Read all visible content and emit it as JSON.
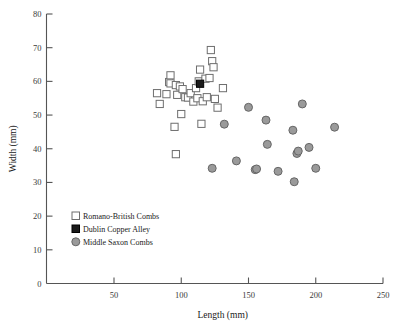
{
  "chart_data": {
    "type": "scatter",
    "title": "",
    "xlabel": "Length (mm)",
    "ylabel": "Width (mm)",
    "xlim": [
      0,
      250
    ],
    "ylim": [
      0,
      80
    ],
    "xticks": [
      50,
      100,
      150,
      200,
      250
    ],
    "yticks": [
      0,
      10,
      20,
      30,
      40,
      50,
      60,
      70,
      80
    ],
    "xtick_labels": [
      "50",
      "100",
      "150",
      "200",
      "250"
    ],
    "ytick_labels": [
      "0",
      "10",
      "20",
      "30",
      "40",
      "50",
      "60",
      "70",
      "80"
    ],
    "grid": false,
    "legend_position": "lower-left",
    "series": [
      {
        "name": "Romano-British Combs",
        "marker": "square",
        "fill": "#ffffff",
        "stroke": "#6e6e6e",
        "points": [
          [
            82,
            56.5
          ],
          [
            84,
            53.3
          ],
          [
            89,
            56.2
          ],
          [
            91,
            59.8
          ],
          [
            92,
            61.8
          ],
          [
            92,
            59.4
          ],
          [
            95,
            46.5
          ],
          [
            96,
            38.4
          ],
          [
            96,
            58.9
          ],
          [
            97,
            56.0
          ],
          [
            99,
            58.5
          ],
          [
            100,
            50.3
          ],
          [
            101,
            57.7
          ],
          [
            103,
            55.3
          ],
          [
            105,
            55.2
          ],
          [
            107,
            56.5
          ],
          [
            109,
            54.0
          ],
          [
            111,
            58.0
          ],
          [
            112,
            55.0
          ],
          [
            113,
            60.0
          ],
          [
            114,
            63.5
          ],
          [
            115,
            47.4
          ],
          [
            116,
            54.1
          ],
          [
            118,
            60.8
          ],
          [
            119,
            55.3
          ],
          [
            121,
            61.0
          ],
          [
            122,
            69.3
          ],
          [
            123,
            66.0
          ],
          [
            124,
            64.2
          ],
          [
            125,
            54.8
          ],
          [
            127,
            52.2
          ],
          [
            131,
            58.0
          ]
        ]
      },
      {
        "name": "Dublin Copper Alley",
        "marker": "square",
        "fill": "#1a1a1a",
        "stroke": "#000000",
        "points": [
          [
            114,
            59.3
          ]
        ]
      },
      {
        "name": "Middle Saxon Combs",
        "marker": "circle",
        "fill": "#9a9a9a",
        "stroke": "#666666",
        "points": [
          [
            123,
            34.2
          ],
          [
            132,
            47.3
          ],
          [
            141,
            36.4
          ],
          [
            150,
            52.3
          ],
          [
            155,
            33.8
          ],
          [
            156,
            34.0
          ],
          [
            163,
            48.5
          ],
          [
            164,
            41.3
          ],
          [
            172,
            33.3
          ],
          [
            183,
            45.5
          ],
          [
            184,
            30.2
          ],
          [
            186,
            38.6
          ],
          [
            187,
            39.3
          ],
          [
            190,
            53.3
          ],
          [
            195,
            40.4
          ],
          [
            200,
            34.2
          ],
          [
            214,
            46.4
          ]
        ]
      }
    ]
  },
  "legend": {
    "items": [
      {
        "label": "Romano-British Combs",
        "marker": "open-square"
      },
      {
        "label": "Dublin Copper Alley",
        "marker": "filled-square"
      },
      {
        "label": "Middle Saxon Combs",
        "marker": "grey-circle"
      }
    ]
  },
  "colors": {
    "axis": "#555555",
    "text": "#1a1a1a",
    "tick_text": "#3a3a3a",
    "square_stroke": "#6e6e6e",
    "square_fill": "#ffffff",
    "dublin_fill": "#1a1a1a",
    "circle_fill": "#9a9a9a",
    "circle_stroke": "#666666",
    "background": "#ffffff"
  }
}
